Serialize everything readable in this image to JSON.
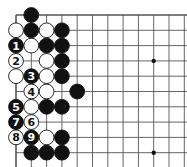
{
  "diagram": {
    "type": "go-board-corner",
    "grid": {
      "origin_x": 16,
      "origin_y": 15,
      "spacing": 15.3,
      "cols": 12,
      "rows": 11
    },
    "star_points": [
      [
        9,
        3
      ],
      [
        9,
        9
      ]
    ],
    "stones": [
      {
        "col": 1,
        "row": 0,
        "color": "black",
        "label": ""
      },
      {
        "col": 0,
        "row": 1,
        "color": "white",
        "label": ""
      },
      {
        "col": 1,
        "row": 1,
        "color": "black",
        "label": ""
      },
      {
        "col": 2,
        "row": 1,
        "color": "white",
        "label": ""
      },
      {
        "col": 3,
        "row": 1,
        "color": "black",
        "label": ""
      },
      {
        "col": 0,
        "row": 2,
        "color": "black",
        "label": "1"
      },
      {
        "col": 1,
        "row": 2,
        "color": "white",
        "label": ""
      },
      {
        "col": 2,
        "row": 2,
        "color": "black",
        "label": ""
      },
      {
        "col": 3,
        "row": 2,
        "color": "black",
        "label": ""
      },
      {
        "col": 0,
        "row": 3,
        "color": "white",
        "label": "2"
      },
      {
        "col": 2,
        "row": 3,
        "color": "white",
        "label": ""
      },
      {
        "col": 3,
        "row": 3,
        "color": "black",
        "label": ""
      },
      {
        "col": 0,
        "row": 4,
        "color": "white",
        "label": ""
      },
      {
        "col": 1,
        "row": 4,
        "color": "black",
        "label": "3"
      },
      {
        "col": 2,
        "row": 4,
        "color": "white",
        "label": ""
      },
      {
        "col": 3,
        "row": 4,
        "color": "black",
        "label": ""
      },
      {
        "col": 1,
        "row": 5,
        "color": "white",
        "label": "4"
      },
      {
        "col": 2,
        "row": 5,
        "color": "white",
        "label": ""
      },
      {
        "col": 4,
        "row": 5,
        "color": "black",
        "label": ""
      },
      {
        "col": 0,
        "row": 6,
        "color": "black",
        "label": "5"
      },
      {
        "col": 1,
        "row": 6,
        "color": "white",
        "label": ""
      },
      {
        "col": 2,
        "row": 6,
        "color": "black",
        "label": ""
      },
      {
        "col": 3,
        "row": 6,
        "color": "black",
        "label": ""
      },
      {
        "col": 0,
        "row": 7,
        "color": "black",
        "label": "7"
      },
      {
        "col": 1,
        "row": 7,
        "color": "white",
        "label": "6"
      },
      {
        "col": 0,
        "row": 8,
        "color": "white",
        "label": "8"
      },
      {
        "col": 1,
        "row": 8,
        "color": "black",
        "label": "9"
      },
      {
        "col": 2,
        "row": 8,
        "color": "white",
        "label": ""
      },
      {
        "col": 3,
        "row": 8,
        "color": "black",
        "label": ""
      },
      {
        "col": 1,
        "row": 9,
        "color": "black",
        "label": ""
      },
      {
        "col": 2,
        "row": 9,
        "color": "black",
        "label": ""
      },
      {
        "col": 3,
        "row": 9,
        "color": "black",
        "label": ""
      }
    ]
  }
}
